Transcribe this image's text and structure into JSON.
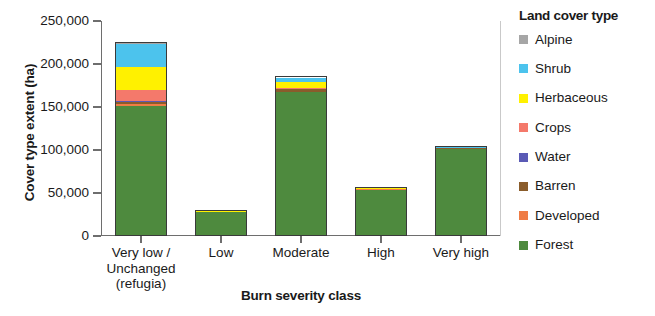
{
  "chart_data": {
    "type": "bar",
    "stacked": true,
    "title": "",
    "xlabel": "Burn severity class",
    "ylabel": "Cover type extent (ha)",
    "ylim": [
      0,
      250000
    ],
    "yticks": [
      0,
      50000,
      100000,
      150000,
      200000,
      250000
    ],
    "ytick_labels": [
      "0",
      "50,000",
      "100,000",
      "150,000",
      "200,000",
      "250,000"
    ],
    "grid": false,
    "legend_position": "right",
    "legend_title": "Land cover type",
    "categories": [
      "Very low /\nUnchanged\n(refugia)",
      "Low",
      "Moderate",
      "High",
      "Very high"
    ],
    "series": [
      {
        "name": "Forest",
        "color": "#4e8a3e",
        "values": [
          152000,
          29000,
          168000,
          55000,
          102000
        ]
      },
      {
        "name": "Developed",
        "color": "#ef7c45",
        "values": [
          1500,
          150,
          900,
          300,
          500
        ]
      },
      {
        "name": "Barren",
        "color": "#8a5c2b",
        "values": [
          2500,
          200,
          2600,
          400,
          700
        ]
      },
      {
        "name": "Water",
        "color": "#5a5ab5",
        "values": [
          900,
          60,
          500,
          150,
          200
        ]
      },
      {
        "name": "Crops",
        "color": "#f4796b",
        "values": [
          13000,
          250,
          1200,
          250,
          300
        ]
      },
      {
        "name": "Herbaceous",
        "color": "#fff100",
        "values": [
          28000,
          150,
          6500,
          400,
          400
        ]
      },
      {
        "name": "Shrub",
        "color": "#4cc3ed",
        "values": [
          27000,
          150,
          5500,
          400,
          400
        ]
      },
      {
        "name": "Alpine",
        "color": "#a6a6a6",
        "values": [
          600,
          40,
          300,
          100,
          100
        ]
      }
    ],
    "totals": [
      225500,
      30000,
      185500,
      57000,
      104600
    ]
  },
  "legend": {
    "title": "Land cover type",
    "items": [
      {
        "label": "Alpine",
        "color": "#a6a6a6"
      },
      {
        "label": "Shrub",
        "color": "#4cc3ed"
      },
      {
        "label": "Herbaceous",
        "color": "#fff100"
      },
      {
        "label": "Crops",
        "color": "#f4796b"
      },
      {
        "label": "Water",
        "color": "#5a5ab5"
      },
      {
        "label": "Barren",
        "color": "#8a5c2b"
      },
      {
        "label": "Developed",
        "color": "#ef7c45"
      },
      {
        "label": "Forest",
        "color": "#4e8a3e"
      }
    ]
  },
  "axes": {
    "y_title": "Cover type extent (ha)",
    "x_title": "Burn severity class"
  }
}
